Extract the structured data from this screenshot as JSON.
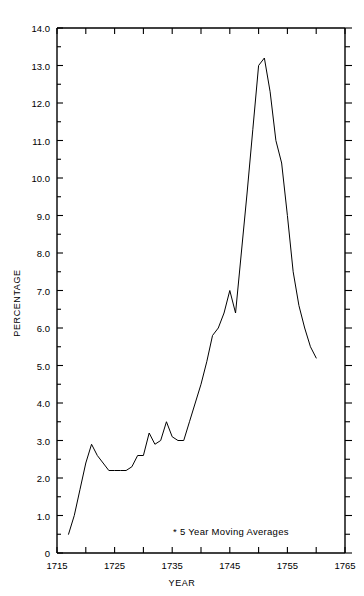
{
  "chart_data": {
    "type": "line",
    "title": "",
    "subtitle": "",
    "xlabel": "YEAR",
    "ylabel": "PERCENTAGE",
    "xlim": [
      1715,
      1765
    ],
    "ylim": [
      0,
      14.0
    ],
    "grid": false,
    "legend_position": "none",
    "annotations": [
      "* 5 Year Moving Averages"
    ],
    "x_tick_labels": [
      "1715",
      "1725",
      "1735",
      "1745",
      "1755",
      "1765"
    ],
    "x_tick_values": [
      1715,
      1725,
      1735,
      1745,
      1755,
      1765
    ],
    "x_minor_tick_values": [
      1720,
      1730,
      1740,
      1750,
      1760
    ],
    "y_tick_labels": [
      "0",
      "1.0",
      "2.0",
      "3.0",
      "4.0",
      "5.0",
      "6.0",
      "7.0",
      "8.0",
      "9.0",
      "10.0",
      "11.0",
      "12.0",
      "13.0",
      "14.0"
    ],
    "y_tick_values": [
      0,
      1.0,
      2.0,
      3.0,
      4.0,
      5.0,
      6.0,
      7.0,
      8.0,
      9.0,
      10.0,
      11.0,
      12.0,
      13.0,
      14.0
    ],
    "y_minor_tick_values": [
      0.5,
      1.5,
      2.5,
      3.5,
      4.5,
      5.5,
      6.5,
      7.5,
      8.5,
      9.5,
      10.5,
      11.5,
      12.5,
      13.5
    ],
    "line_color": "#000000",
    "line_width": 1.0,
    "series": [
      {
        "name": "Percentage",
        "x": [
          1717,
          1718,
          1719,
          1720,
          1721,
          1722,
          1723,
          1724,
          1725,
          1726,
          1727,
          1728,
          1729,
          1730,
          1731,
          1732,
          1733,
          1734,
          1735,
          1736,
          1737,
          1738,
          1739,
          1740,
          1741,
          1742,
          1743,
          1744,
          1745,
          1746,
          1747,
          1748,
          1749,
          1750,
          1751,
          1752,
          1753,
          1754,
          1755,
          1756,
          1757,
          1758,
          1759,
          1760
        ],
        "values": [
          0.5,
          1.0,
          1.7,
          2.4,
          2.9,
          2.6,
          2.4,
          2.2,
          2.2,
          2.2,
          2.2,
          2.3,
          2.6,
          2.6,
          3.2,
          2.9,
          3.0,
          3.5,
          3.1,
          3.0,
          3.0,
          3.5,
          4.0,
          4.5,
          5.1,
          5.8,
          6.0,
          6.4,
          7.0,
          6.4,
          8.0,
          9.6,
          11.3,
          13.0,
          13.2,
          12.3,
          11.0,
          10.4,
          9.0,
          7.5,
          6.6,
          6.0,
          5.5,
          5.2
        ]
      }
    ]
  },
  "axes": {
    "x_axis_name": "year-axis",
    "y_axis_name": "percentage-axis"
  }
}
